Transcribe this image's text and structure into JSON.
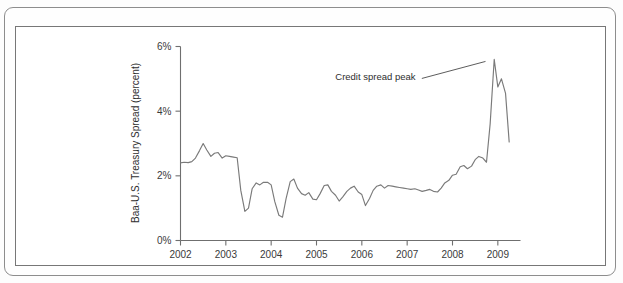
{
  "figure": {
    "background_color": "#fdfdfd",
    "frame_color": "#8d8d8d",
    "inner_frame_color": "#777777"
  },
  "chart_data": {
    "type": "line",
    "title": "",
    "subtitle": "",
    "xlabel": "",
    "ylabel": "Baa-U.S. Treasury Spread (percent)",
    "xlim": [
      2002.0,
      2009.5
    ],
    "ylim": [
      0,
      6
    ],
    "grid": false,
    "legend": false,
    "legend_position": "none",
    "line_color": "#7a7a7a",
    "x_tick_labels": [
      "2002",
      "2003",
      "2004",
      "2005",
      "2006",
      "2007",
      "2008",
      "2009"
    ],
    "x_tick_values": [
      2002,
      2003,
      2004,
      2005,
      2006,
      2007,
      2008,
      2009
    ],
    "y_tick_labels": [
      "0%",
      "2%",
      "4%",
      "6%"
    ],
    "y_tick_values": [
      0,
      2,
      4,
      6
    ],
    "annotations": [
      {
        "text": "Credit spread peak",
        "target_x": 2008.75,
        "target_y": 5.6,
        "label_x": 2006.3,
        "label_y": 4.95
      }
    ],
    "series": [
      {
        "name": "Baa-U.S. Treasury Spread",
        "color": "#7a7a7a",
        "x": [
          2002.0,
          2002.08,
          2002.17,
          2002.25,
          2002.33,
          2002.42,
          2002.5,
          2002.58,
          2002.67,
          2002.75,
          2002.83,
          2002.92,
          2003.0,
          2003.08,
          2003.17,
          2003.25,
          2003.33,
          2003.42,
          2003.5,
          2003.58,
          2003.67,
          2003.75,
          2003.83,
          2003.92,
          2004.0,
          2004.08,
          2004.17,
          2004.25,
          2004.33,
          2004.42,
          2004.5,
          2004.58,
          2004.67,
          2004.75,
          2004.83,
          2004.92,
          2005.0,
          2005.08,
          2005.17,
          2005.25,
          2005.33,
          2005.42,
          2005.5,
          2005.58,
          2005.67,
          2005.75,
          2005.83,
          2005.92,
          2006.0,
          2006.08,
          2006.17,
          2006.25,
          2006.33,
          2006.42,
          2006.5,
          2006.58,
          2006.67,
          2006.75,
          2006.83,
          2006.92,
          2007.0,
          2007.08,
          2007.17,
          2007.25,
          2007.33,
          2007.42,
          2007.5,
          2007.58,
          2007.67,
          2007.75,
          2007.83,
          2007.92,
          2008.0,
          2008.08,
          2008.17,
          2008.25,
          2008.33,
          2008.42,
          2008.5,
          2008.58,
          2008.67,
          2008.75,
          2008.83,
          2008.92,
          2009.0,
          2009.08,
          2009.17,
          2009.25
        ],
        "values": [
          2.4,
          2.42,
          2.41,
          2.44,
          2.55,
          2.78,
          3.0,
          2.8,
          2.6,
          2.7,
          2.72,
          2.55,
          2.62,
          2.6,
          2.58,
          2.56,
          1.55,
          0.9,
          1.0,
          1.6,
          1.78,
          1.72,
          1.8,
          1.8,
          1.72,
          1.2,
          0.78,
          0.72,
          1.3,
          1.82,
          1.9,
          1.62,
          1.45,
          1.4,
          1.48,
          1.28,
          1.26,
          1.45,
          1.7,
          1.72,
          1.52,
          1.4,
          1.22,
          1.35,
          1.52,
          1.62,
          1.68,
          1.5,
          1.42,
          1.08,
          1.3,
          1.55,
          1.68,
          1.72,
          1.62,
          1.7,
          1.68,
          1.66,
          1.64,
          1.62,
          1.6,
          1.58,
          1.6,
          1.56,
          1.52,
          1.55,
          1.58,
          1.52,
          1.5,
          1.62,
          1.78,
          1.86,
          2.02,
          2.05,
          2.28,
          2.32,
          2.22,
          2.3,
          2.5,
          2.6,
          2.55,
          2.42,
          3.6,
          5.6,
          4.75,
          5.0,
          4.55,
          3.05
        ]
      }
    ]
  }
}
